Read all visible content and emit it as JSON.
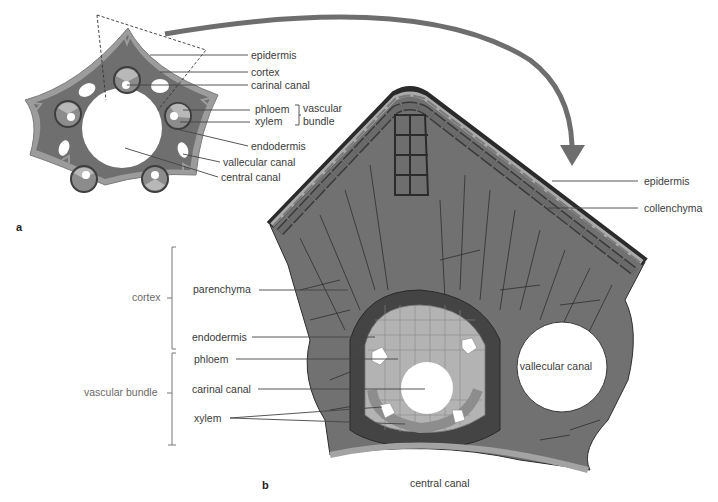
{
  "figure": {
    "panels": [
      {
        "id": "a",
        "label": "a",
        "description": "Transverse section of a horsetail (Equisetum) stem, pentagonal outline"
      },
      {
        "id": "b",
        "label": "b",
        "description": "Enlarged detail of one ridge sector of the stem"
      }
    ],
    "colors": {
      "epidermis": "#9a9a9a",
      "cortex": "#707070",
      "endodermis_ring": "#4a4a4a",
      "phloem": "#b5b5b5",
      "xylem": "#8c8c8c",
      "canal": "#ffffff",
      "arrow": "#6e6e6e",
      "outline": "#2b2b2b"
    }
  },
  "panel_a": {
    "label": "a",
    "labels": {
      "epidermis": "epidermis",
      "cortex": "cortex",
      "carinal_canal": "carinal canal",
      "phloem": "phloem",
      "xylem": "xylem",
      "vascular_bundle_line1": "vascular",
      "vascular_bundle_line2": "bundle",
      "endodermis": "endodermis",
      "vallecular_canal": "vallecular canal",
      "central_canal": "central canal"
    }
  },
  "panel_b": {
    "label": "b",
    "right_labels": {
      "epidermis": "epidermis",
      "collenchyma": "collenchyma"
    },
    "left_labels": {
      "parenchyma": "parenchyma",
      "endodermis": "endodermis",
      "phloem": "phloem",
      "carinal_canal": "carinal canal",
      "xylem": "xylem"
    },
    "groups": {
      "cortex": "cortex",
      "vascular_bundle": "vascular bundle"
    },
    "inline_labels": {
      "vallecular_canal": "vallecular canal",
      "central_canal": "central canal"
    }
  }
}
